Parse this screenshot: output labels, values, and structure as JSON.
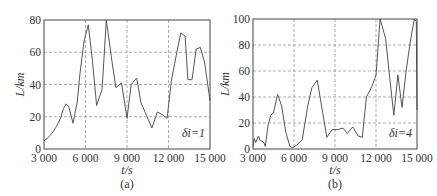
{
  "chart_data": [
    {
      "type": "line",
      "panel": "(a)",
      "annotation": "δi=1",
      "xlabel": "t/s",
      "ylabel": "L/km",
      "xlim": [
        3000,
        15000
      ],
      "ylim": [
        0,
        80
      ],
      "xticks": [
        3000,
        6000,
        9000,
        12000,
        15000
      ],
      "xtick_labels": [
        "3 000",
        "6 000",
        "9 000",
        "12 000",
        "15 000"
      ],
      "yticks": [
        0,
        20,
        40,
        60,
        80
      ],
      "ytick_labels": [
        "0",
        "20",
        "40",
        "60",
        "80"
      ],
      "grid": true,
      "frame": {
        "left": 44,
        "top": 20,
        "right": 210,
        "bottom": 149
      },
      "x": [
        3000,
        3300,
        3600,
        3900,
        4200,
        4400,
        4600,
        4800,
        5100,
        5400,
        5600,
        5900,
        6200,
        6500,
        6800,
        7200,
        7500,
        7900,
        8200,
        8600,
        9000,
        9300,
        9700,
        10000,
        10400,
        10800,
        11200,
        11600,
        11900,
        12200,
        12600,
        12900,
        13200,
        13400,
        13700,
        14000,
        14300,
        14600,
        15000
      ],
      "values": [
        5,
        7,
        10,
        14,
        19,
        25,
        28,
        26,
        16,
        29,
        47,
        67,
        77,
        55,
        27,
        37,
        80,
        55,
        38,
        41,
        19,
        40,
        44,
        29,
        21,
        13,
        23,
        21,
        19,
        42,
        60,
        72,
        70,
        43,
        43,
        62,
        63,
        54,
        30
      ]
    },
    {
      "type": "line",
      "panel": "(b)",
      "annotation": "δi=4",
      "xlabel": "t/s",
      "ylabel": "L/km",
      "xlim": [
        3000,
        15000
      ],
      "ylim": [
        0,
        100
      ],
      "xticks": [
        3000,
        6000,
        9000,
        12000,
        15000
      ],
      "xtick_labels": [
        "3 000",
        "6 000",
        "9 000",
        "12 000",
        "15 000"
      ],
      "yticks": [
        0,
        20,
        40,
        60,
        80,
        100
      ],
      "ytick_labels": [
        "0",
        "20",
        "40",
        "60",
        "80",
        "100"
      ],
      "grid": true,
      "frame": {
        "left": 253,
        "top": 19,
        "right": 417,
        "bottom": 149
      },
      "x": [
        3000,
        3100,
        3200,
        3400,
        3500,
        3800,
        3900,
        4100,
        4300,
        4500,
        4800,
        5100,
        5400,
        5700,
        5900,
        6200,
        6600,
        7000,
        7300,
        7700,
        8100,
        8400,
        8800,
        9200,
        9600,
        9900,
        10300,
        10700,
        11000,
        11300,
        11700,
        12000,
        12300,
        12700,
        13000,
        13300,
        13600,
        13900,
        14200,
        14500,
        14800,
        14950,
        15000
      ],
      "values": [
        2,
        8,
        5,
        10,
        7,
        5,
        2,
        18,
        26,
        28,
        42,
        33,
        13,
        2,
        1,
        3,
        7,
        33,
        47,
        53,
        28,
        9,
        15,
        15,
        16,
        12,
        17,
        10,
        9,
        40,
        48,
        57,
        100,
        85,
        55,
        26,
        57,
        32,
        60,
        82,
        100,
        98,
        30
      ]
    }
  ],
  "colors": {
    "line": "#555555",
    "grid": "#888888",
    "frame": "#444444",
    "text": "#333333"
  }
}
